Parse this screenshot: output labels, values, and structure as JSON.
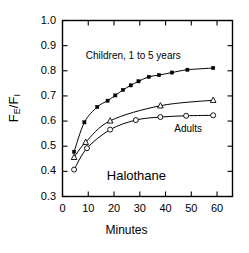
{
  "chart_data": {
    "type": "line",
    "title": "",
    "xlabel": "Minutes",
    "ylabel": "FE/FI",
    "ylabel_parts": {
      "f": "F",
      "sub_e": "E",
      "slash": "/",
      "f2": "F",
      "sub_i": "I"
    },
    "xlim": [
      0,
      66
    ],
    "ylim": [
      0.3,
      1.0
    ],
    "xticks": [
      0,
      10,
      20,
      30,
      40,
      50,
      60
    ],
    "xticklabels": [
      "0",
      "10",
      "20",
      "30",
      "40",
      "50",
      "60"
    ],
    "yticks": [
      0.3,
      0.4,
      0.5,
      0.6,
      0.7,
      0.8,
      0.9,
      1.0
    ],
    "yticklabels": [
      "0.3",
      "0.4",
      "0.5",
      "0.6",
      "0.7",
      "0.8",
      "0.9",
      "1.0"
    ],
    "grid": false,
    "legend_position": "inline-annotations",
    "frame": "box-all-sides-with-inward-ticks",
    "annotations": [
      {
        "text": "Children, 1 to 5 years",
        "x": 30,
        "y": 0.855
      },
      {
        "text": "Adults",
        "x": 50,
        "y": 0.565
      },
      {
        "text": "Halothane",
        "x": 30,
        "y": 0.385
      }
    ],
    "series": [
      {
        "name": "Children, 1 to 5 years",
        "marker": "filled-square",
        "x": [
          4.5,
          8.5,
          13.5,
          17.5,
          20.5,
          23.5,
          26.5,
          29.5,
          33.5,
          37.5,
          42.5,
          48.5,
          58.5
        ],
        "y": [
          0.478,
          0.595,
          0.656,
          0.681,
          0.702,
          0.724,
          0.742,
          0.758,
          0.776,
          0.783,
          0.793,
          0.804,
          0.811
        ]
      },
      {
        "name": "Middle (unlabeled)",
        "marker": "open-triangle",
        "x": [
          4.5,
          9.0,
          18.5,
          38.0,
          58.5
        ],
        "y": [
          0.456,
          0.516,
          0.601,
          0.661,
          0.683
        ]
      },
      {
        "name": "Adults",
        "marker": "open-circle",
        "x": [
          4.5,
          9.5,
          18.5,
          28.5,
          38.0,
          48.0,
          58.5
        ],
        "y": [
          0.407,
          0.492,
          0.566,
          0.604,
          0.616,
          0.621,
          0.623
        ]
      }
    ]
  }
}
